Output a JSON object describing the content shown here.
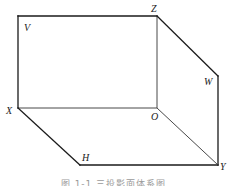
{
  "diagram": {
    "type": "three-projection-plane-system",
    "labels": {
      "V": "V",
      "Z": "Z",
      "W": "W",
      "X": "X",
      "O": "O",
      "H": "H",
      "Y": "Y"
    },
    "caption": "图 1-1   三投影面体系图",
    "colors": {
      "line": "#1a1a1a",
      "label": "#222222",
      "caption": "#9a9a9a",
      "background": "#ffffff"
    }
  }
}
